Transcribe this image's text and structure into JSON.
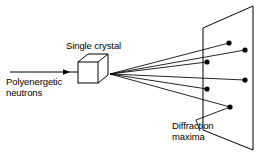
{
  "figure": {
    "background_color": "#ffffff",
    "stroke_color": "#000000",
    "text_color": "#000000",
    "labels": {
      "beam_line1": "Polyenergetic",
      "beam_line2": "neutrons",
      "crystal": "Single crystal",
      "maxima_line1": "Diffraction",
      "maxima_line2": "maxima"
    },
    "incident_beam": {
      "name": "incident-neutron-beam",
      "x1": 10,
      "y1": 72,
      "x2": 78,
      "y2": 72,
      "arrowhead_x": 68
    },
    "crystal": {
      "name": "single-crystal-cube",
      "front_face": {
        "x": 78,
        "y": 62,
        "w": 20,
        "h": 21
      },
      "depth_dx": 10,
      "depth_dy": -8
    },
    "scatter_origin": {
      "x": 110,
      "y": 74
    },
    "screen": {
      "name": "detector-screen",
      "top_left": {
        "x": 203,
        "y": 28
      },
      "top_right": {
        "x": 253,
        "y": 6
      },
      "bottom_right": {
        "x": 253,
        "y": 150
      },
      "bottom_left": {
        "x": 203,
        "y": 130
      }
    },
    "diffraction_spots": [
      {
        "id": "spot-1",
        "x": 229,
        "y": 43,
        "r": 2.6
      },
      {
        "id": "spot-2",
        "x": 245,
        "y": 50,
        "r": 2.6
      },
      {
        "id": "spot-3",
        "x": 207,
        "y": 62,
        "r": 2.6
      },
      {
        "id": "spot-4",
        "x": 245,
        "y": 80,
        "r": 2.6
      },
      {
        "id": "spot-5",
        "x": 207,
        "y": 89,
        "r": 2.6
      },
      {
        "id": "spot-6",
        "x": 230,
        "y": 107,
        "r": 2.6
      }
    ],
    "diffracted_rays": [
      {
        "id": "ray-1",
        "to_x": 229,
        "to_y": 43
      },
      {
        "id": "ray-2",
        "to_x": 245,
        "to_y": 50
      },
      {
        "id": "ray-3",
        "to_x": 207,
        "to_y": 62
      },
      {
        "id": "ray-4",
        "to_x": 245,
        "to_y": 80
      },
      {
        "id": "ray-5",
        "to_x": 207,
        "to_y": 89
      },
      {
        "id": "ray-6",
        "to_x": 230,
        "to_y": 107
      }
    ],
    "leader_line": {
      "name": "maxima-leader-line",
      "points": "200,131 196,120 230,107"
    }
  }
}
